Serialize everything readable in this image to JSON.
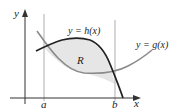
{
  "figure": {
    "type": "area-between-curves",
    "axes": {
      "x_label": "x",
      "y_label": "y"
    },
    "bounds": {
      "a_label": "a",
      "b_label": "b"
    },
    "curves": [
      {
        "name": "h",
        "label": "y = h(x)",
        "color": "#222222"
      },
      {
        "name": "g",
        "label": "y = g(x)",
        "color": "#8a8a8a"
      }
    ],
    "region": {
      "label": "R",
      "fill": "#e6e6e6"
    }
  }
}
